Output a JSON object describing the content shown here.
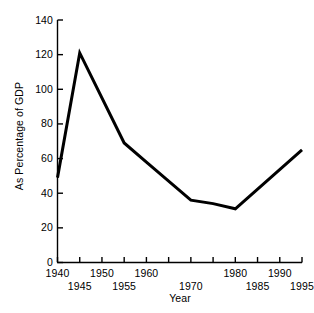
{
  "chart_data": {
    "type": "line",
    "title": "",
    "xlabel": "Year",
    "ylabel": "As Percentage of GDP",
    "x": [
      1940,
      1945,
      1955,
      1960,
      1970,
      1975,
      1980,
      1995
    ],
    "values": [
      49,
      121,
      69,
      58,
      36,
      34,
      31,
      65
    ],
    "series": [
      {
        "name": "Debt as Percentage of GDP",
        "x": [
          1940,
          1945,
          1955,
          1960,
          1970,
          1975,
          1980,
          1995
        ],
        "values": [
          49,
          121,
          69,
          58,
          36,
          34,
          31,
          65
        ]
      }
    ],
    "xlim": [
      1940,
      1995
    ],
    "ylim": [
      0,
      140
    ],
    "yticks": [
      0,
      20,
      40,
      60,
      80,
      100,
      120,
      140
    ],
    "ytick_labels": [
      "0",
      "20",
      "40",
      "60",
      "80",
      "100",
      "120",
      "140"
    ],
    "xticks": [
      1940,
      1945,
      1950,
      1955,
      1960,
      1965,
      1970,
      1975,
      1980,
      1985,
      1990,
      1995
    ],
    "xtick_labels": [
      "1940",
      "1945",
      "1950",
      "1955",
      "1960",
      "",
      "1970",
      "",
      "1980",
      "1985",
      "1990",
      "1995"
    ],
    "xtick_rows": [
      0,
      1,
      0,
      1,
      0,
      0,
      1,
      0,
      0,
      1,
      0,
      1
    ],
    "grid": false,
    "legend": "none",
    "line_color": "#000000",
    "line_width": 3,
    "background_color": "#ffffff"
  }
}
